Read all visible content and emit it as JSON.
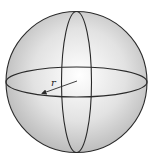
{
  "diagram": {
    "shape": "sphere",
    "radius_label": "r",
    "colors": {
      "outline": "#2a2a2a",
      "fill_light": "#ffffff",
      "fill_dark": "#b8b8b8",
      "background": "#ffffff"
    },
    "elements": [
      {
        "name": "sphere-outline",
        "type": "circle"
      },
      {
        "name": "equator",
        "type": "ellipse",
        "orientation": "horizontal"
      },
      {
        "name": "meridian",
        "type": "ellipse",
        "orientation": "vertical"
      },
      {
        "name": "radius-arrow",
        "type": "arrow",
        "label": "r"
      }
    ]
  }
}
